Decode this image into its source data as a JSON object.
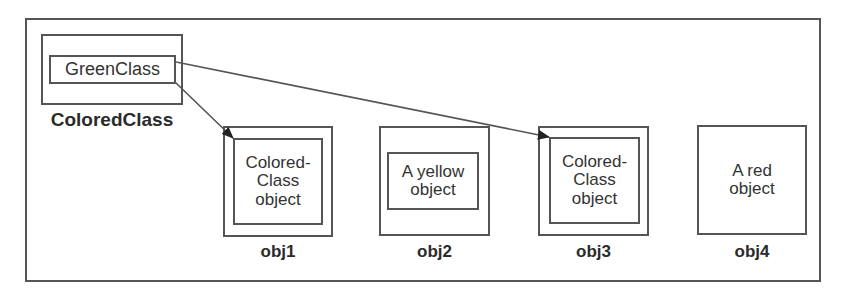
{
  "diagram": {
    "class_box": {
      "label": "ColoredClass",
      "inner_label": "GreenClass"
    },
    "objects": [
      {
        "id": "obj1",
        "label": "obj1",
        "inner_text": [
          "Colored-",
          "Class",
          "object"
        ],
        "has_inner_box": true
      },
      {
        "id": "obj2",
        "label": "obj2",
        "inner_text": [
          "A yellow",
          "object"
        ],
        "has_inner_box": true
      },
      {
        "id": "obj3",
        "label": "obj3",
        "inner_text": [
          "Colored-",
          "Class",
          "object"
        ],
        "has_inner_box": true
      },
      {
        "id": "obj4",
        "label": "obj4",
        "inner_text": [
          "A red",
          "object"
        ],
        "has_inner_box": false
      }
    ],
    "arrows": [
      {
        "from": "GreenClass",
        "to": "obj1"
      },
      {
        "from": "GreenClass",
        "to": "obj3"
      }
    ],
    "colors": {
      "stroke": "#555555",
      "text": "#2b2b2b",
      "background": "#ffffff"
    }
  }
}
